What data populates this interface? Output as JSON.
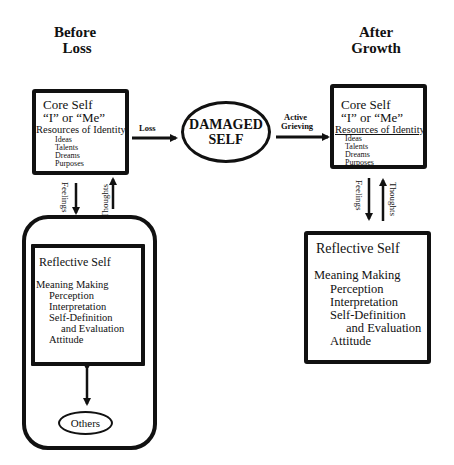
{
  "headings": {
    "before": [
      "Before",
      "Loss"
    ],
    "after": [
      "After",
      "Growth"
    ]
  },
  "core_self_before": {
    "title": "Core Self",
    "subtitle": "“I” or “Me”",
    "resources_label": "Resources of Identity",
    "items": [
      "Ideas",
      "Talents",
      "Dreams",
      "Purposes"
    ]
  },
  "core_self_after": {
    "title": "Core Self",
    "subtitle": "“I” or “Me”",
    "resources_label": "Resources of Identity",
    "items": [
      "Ideas",
      "Talents",
      "Dreams",
      "Purposes"
    ]
  },
  "damaged_self": {
    "line1": "DAMAGED",
    "line2": "SELF"
  },
  "arrows": {
    "loss": "Loss",
    "active_grieving": [
      "Active",
      "Grieving"
    ],
    "feelings": "Feelings",
    "thoughts": "Thoughts"
  },
  "reflective_self_before": {
    "title": "Reflective Self",
    "meaning_making": "Meaning Making",
    "items": [
      "Perception",
      "Interpretation",
      "Self-Definition",
      "and Evaluation",
      "Attitude"
    ]
  },
  "reflective_self_after": {
    "title": "Reflective Self",
    "meaning_making": "Meaning Making",
    "items": [
      "Perception",
      "Interpretation",
      "Self-Definition",
      "and Evaluation",
      "Attitude"
    ]
  },
  "others": {
    "label": "Others"
  }
}
